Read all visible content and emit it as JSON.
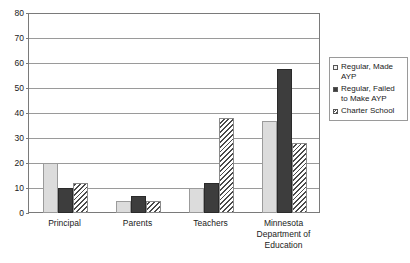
{
  "chart_data": {
    "type": "bar",
    "title": "",
    "subtitle": "",
    "xlabel": "",
    "ylabel": "",
    "ylim": [
      0,
      80
    ],
    "ytick_step": 10,
    "yticks": [
      "80",
      "70",
      "60",
      "50",
      "40",
      "30",
      "20",
      "10",
      "0"
    ],
    "grid": true,
    "legend_position": "right",
    "categories": [
      "Principal",
      "Parents",
      "Teachers",
      "Minnesota Department of Education"
    ],
    "category_lines": [
      [
        "Principal"
      ],
      [
        "Parents"
      ],
      [
        "Teachers"
      ],
      [
        "Minnesota",
        "Department of",
        "Education"
      ]
    ],
    "series": [
      {
        "name": "Regular, Made AYP",
        "name_lines": [
          "Regular, Made",
          "AYP"
        ],
        "values": [
          20,
          5,
          10,
          37
        ],
        "fill": "light-solid",
        "color": "#dcdcdc"
      },
      {
        "name": "Regular, Failed to Make AYP",
        "name_lines": [
          "Regular, Failed",
          "to Make AYP"
        ],
        "values": [
          10,
          7,
          12,
          58
        ],
        "fill": "dark-solid",
        "color": "#3d3d3d"
      },
      {
        "name": "Charter School",
        "name_lines": [
          "Charter School"
        ],
        "values": [
          12,
          5,
          38,
          28
        ],
        "fill": "diagonal-hatch",
        "color": "#4a4a4a"
      }
    ]
  },
  "legend": {
    "items": [
      {
        "label": "Regular, Made AYP"
      },
      {
        "label": "Regular, Failed to Make AYP"
      },
      {
        "label": "Charter School"
      }
    ]
  }
}
